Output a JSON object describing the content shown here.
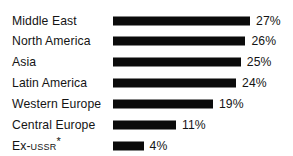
{
  "chart_data": {
    "type": "bar",
    "orientation": "horizontal",
    "title": "",
    "subtitle": "",
    "xlabel": "",
    "ylabel": "",
    "grid": false,
    "legend": null,
    "axis_visible": false,
    "value_suffix": "%",
    "xlim": [
      0,
      30
    ],
    "categories": [
      "Middle East",
      "North America",
      "Asia",
      "Latin America",
      "Western Europe",
      "Central Europe",
      "Ex-USSR*"
    ],
    "values": [
      27,
      26,
      25,
      24,
      19,
      11,
      4
    ],
    "value_labels": [
      "27%",
      "26%",
      "25%",
      "24%",
      "19%",
      "11%",
      "4%"
    ],
    "bar_color": "#0b0b0b",
    "background_color": "#ffffff",
    "footnote_marker": "*"
  },
  "rows": [
    {
      "label": "Middle East",
      "label_pre": "Middle East",
      "label_sc": "",
      "label_star": "",
      "value": 27,
      "value_label": "27%"
    },
    {
      "label": "North America",
      "label_pre": "North America",
      "label_sc": "",
      "label_star": "",
      "value": 26,
      "value_label": "26%"
    },
    {
      "label": "Asia",
      "label_pre": "Asia",
      "label_sc": "",
      "label_star": "",
      "value": 25,
      "value_label": "25%"
    },
    {
      "label": "Latin America",
      "label_pre": "Latin America",
      "label_sc": "",
      "label_star": "",
      "value": 24,
      "value_label": "24%"
    },
    {
      "label": "Western Europe",
      "label_pre": "Western Europe",
      "label_sc": "",
      "label_star": "",
      "value": 19,
      "value_label": "19%"
    },
    {
      "label": "Central Europe",
      "label_pre": "Central Europe",
      "label_sc": "",
      "label_star": "",
      "value": 11,
      "value_label": "11%"
    },
    {
      "label": "Ex-USSR*",
      "label_pre": "Ex-",
      "label_sc": "USSR",
      "label_star": "*",
      "value": 4,
      "value_label": "4%"
    }
  ]
}
